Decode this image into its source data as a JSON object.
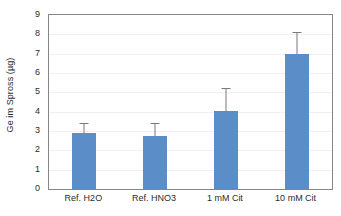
{
  "chart_data": {
    "type": "bar",
    "title": "",
    "xlabel": "",
    "ylabel": "Ge im Spross (µg)",
    "categories": [
      "Ref. H2O",
      "Ref. HNO3",
      "1 mM Cit",
      "10 mM Cit"
    ],
    "values": [
      2.9,
      2.75,
      4.05,
      7.0
    ],
    "errors_upper": [
      0.5,
      0.65,
      1.15,
      1.1
    ],
    "errors_lower": [
      0,
      0,
      0,
      0
    ],
    "ylim": [
      0,
      9
    ],
    "ytick_labels": [
      "0",
      "1",
      "2",
      "3",
      "4",
      "5",
      "6",
      "7",
      "8",
      "9"
    ],
    "ytick_values": [
      0,
      1,
      2,
      3,
      4,
      5,
      6,
      7,
      8,
      9
    ],
    "grid": true,
    "grid_axis": "y",
    "legend": false,
    "legend_position": "none",
    "series": [
      {
        "name": "Ge im Spross",
        "values": [
          2.9,
          2.75,
          4.05,
          7.0
        ],
        "errors_upper": [
          0.5,
          0.65,
          1.15,
          1.1
        ],
        "color": "#5b8ec9"
      }
    ],
    "colors": {
      "bar": "#5b8ec9",
      "error_bar": "#7a7a7a",
      "gridline": "#f0f0f0",
      "axis_frame": "#868686",
      "text": "#2b2b2b",
      "background": "#ffffff"
    }
  }
}
